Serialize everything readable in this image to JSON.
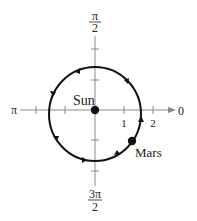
{
  "diagram": {
    "type": "polar-orbit",
    "labels": {
      "angle_top_num": "π",
      "angle_top_den": "2",
      "angle_bottom_num": "3π",
      "angle_bottom_den": "2",
      "angle_left": "π",
      "angle_right": "0",
      "tick_1": "1",
      "tick_2": "2",
      "sun": "Sun",
      "mars": "Mars"
    },
    "polar_axis": {
      "directions": [
        "0",
        "π/2",
        "π",
        "3π/2"
      ],
      "radial_ticks": [
        1,
        2
      ],
      "units_visible": "0 to 2"
    },
    "bodies": [
      {
        "name": "Sun",
        "position": "pole (origin)"
      },
      {
        "name": "Mars",
        "position": "on orbit, lower-right quadrant"
      }
    ],
    "orbit": {
      "shape": "near-circular ellipse",
      "direction": "counterclockwise",
      "focus": "Sun",
      "approx_radius_units": 1.6
    },
    "colors": {
      "orbit": "#111111",
      "axis": "#8a8a8a",
      "text": "#222222",
      "background": "#ffffff"
    }
  }
}
